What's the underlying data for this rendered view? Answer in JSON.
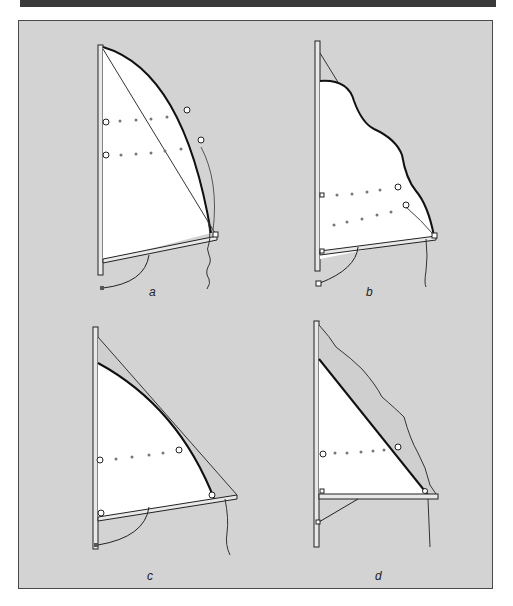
{
  "colors": {
    "top_bar": "#3a3a3a",
    "panel_bg": "#d3d3d3",
    "panel_border": "#4a4a4a",
    "sail_fill": "#ffffff",
    "line": "#222222"
  },
  "figures": [
    {
      "id": "a",
      "label": "a",
      "description": "Full sail, fully rigged, batten window rows"
    },
    {
      "id": "b",
      "label": "b",
      "description": "Sail with slack wavy leech, outhaul eased"
    },
    {
      "id": "c",
      "label": "c",
      "description": "Reefed sail, smaller head curve"
    },
    {
      "id": "d",
      "label": "d",
      "description": "Sail with loose wavy luff cloth and straight leech"
    }
  ]
}
